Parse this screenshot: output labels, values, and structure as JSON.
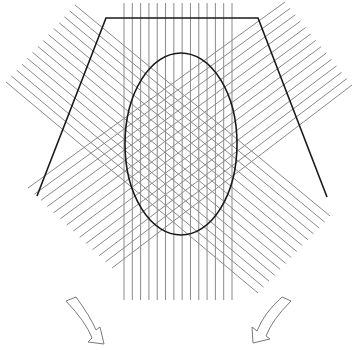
{
  "figure": {
    "description": "Schematic of three sets of parallel lines (vertical, descending diagonal, ascending diagonal) crossing over an elliptical region inside a trapezoidal outline, with two curved outlined arrows pointing down-outward at the bottom",
    "colors": {
      "background": "#ffffff",
      "hatch_lines": "#8a8a8a",
      "outline": "#1a1a1a",
      "arrow_stroke": "#7a7a7a"
    },
    "vertical_band": {
      "count": 14,
      "x_start": 124,
      "x_end": 232,
      "y_top": 3,
      "y_bottom": 300
    },
    "descending_band": {
      "count": 14,
      "start_from": [
        75,
        5
      ],
      "start_to": [
        6,
        82
      ],
      "end_from": [
        330,
        216
      ],
      "end_to": [
        258,
        293
      ]
    },
    "ascending_band": {
      "count": 14,
      "start_from": [
        28,
        188
      ],
      "start_to": [
        112,
        268
      ],
      "end_from": [
        285,
        2
      ],
      "end_to": [
        352,
        85
      ]
    },
    "trapezoid": {
      "points": [
        [
          37,
          196
        ],
        [
          106,
          18
        ],
        [
          258,
          18
        ],
        [
          327,
          197
        ]
      ]
    },
    "ellipse": {
      "cx": 181,
      "cy": 144,
      "rx": 56,
      "ry": 91
    },
    "arrows": [
      {
        "name": "left-arrow",
        "direction": "down-right"
      },
      {
        "name": "right-arrow",
        "direction": "down-left"
      }
    ]
  }
}
